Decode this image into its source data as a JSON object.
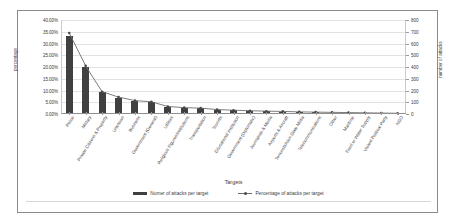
{
  "chart_data": {
    "type": "bar",
    "title": "",
    "xlabel": "Targets",
    "ylabel": "percentage",
    "y2label": "number of attacks",
    "ylim": [
      0,
      0.4
    ],
    "y2lim": [
      0,
      800
    ],
    "grid": true,
    "legend_position": "bottom",
    "categories": [
      "Police",
      "Military",
      "Private Citizens & Property",
      "Unknown",
      "Business",
      "Government (General)",
      "Utilities",
      "Religious Figures/Institutions",
      "Transportation",
      "Tourists",
      "Educational Institution",
      "Government (Diplomatic)",
      "Journalists & Media",
      "Airports & Aircraft",
      "Terrorists/Non-State Militia",
      "Telecommunications",
      "Other",
      "Maritime",
      "Food or Water Supply",
      "Violent Political Party",
      "NGO"
    ],
    "series": [
      {
        "name": "Numer of attacks per target",
        "axis": "right",
        "type": "bar",
        "values": [
          660,
          400,
          190,
          140,
          112,
          100,
          62,
          52,
          48,
          36,
          30,
          26,
          22,
          20,
          18,
          14,
          12,
          10,
          8,
          6,
          4
        ]
      },
      {
        "name": "Percentage of attacks per target",
        "axis": "left",
        "type": "line",
        "values": [
          0.345,
          0.205,
          0.095,
          0.072,
          0.057,
          0.052,
          0.032,
          0.027,
          0.025,
          0.019,
          0.016,
          0.014,
          0.012,
          0.011,
          0.009,
          0.008,
          0.007,
          0.006,
          0.005,
          0.004,
          0.003
        ]
      }
    ],
    "ytick_labels": [
      "40.00%",
      "35.00%",
      "30.00%",
      "25.00%",
      "20.00%",
      "15.00%",
      "10.00%",
      "5.00%",
      "0.00%"
    ],
    "ytick_values": [
      0.4,
      0.35,
      0.3,
      0.25,
      0.2,
      0.15,
      0.1,
      0.05,
      0.0
    ],
    "y2tick_labels": [
      "800",
      "700",
      "600",
      "500",
      "400",
      "300",
      "200",
      "100",
      "0"
    ],
    "y2tick_values": [
      800,
      700,
      600,
      500,
      400,
      300,
      200,
      100,
      0
    ],
    "colors": {
      "bar": "#404040",
      "line": "#6e6e6e",
      "grid": "#e2e2e2",
      "text": "#3b3b3b",
      "background": "#ffffff",
      "border": "#8a8a8a"
    }
  }
}
